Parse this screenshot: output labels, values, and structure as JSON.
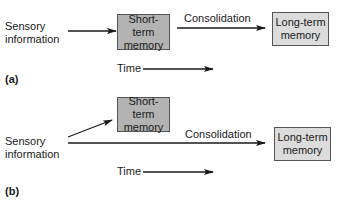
{
  "panel_a": {
    "label": "(a)",
    "sensory": {
      "line1": "Sensory",
      "line2": "information"
    },
    "short_term": {
      "line1": "Short-term",
      "line2": "memory"
    },
    "consolidation": "Consolidation",
    "long_term": {
      "line1": "Long-term",
      "line2": "memory"
    },
    "time": "Time"
  },
  "panel_b": {
    "label": "(b)",
    "sensory": {
      "line1": "Sensory",
      "line2": "information"
    },
    "short_term": {
      "line1": "Short-term",
      "line2": "memory"
    },
    "consolidation": "Consolidation",
    "long_term": {
      "line1": "Long-term",
      "line2": "memory"
    },
    "time": "Time"
  },
  "colors": {
    "short_term_fill": "#b3b3b3",
    "long_term_fill": "#dcdcdc",
    "stroke": "#1a1a1a"
  }
}
